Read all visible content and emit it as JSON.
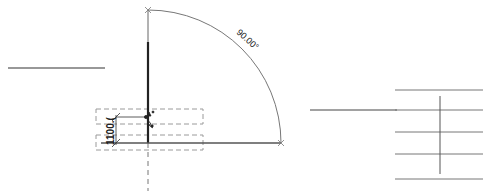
{
  "canvas": {
    "width": 488,
    "height": 191,
    "background": "#ffffff"
  },
  "colors": {
    "line": "#333333",
    "thin_line": "#555555",
    "light_line": "#888888",
    "dashed": "#999999"
  },
  "door": {
    "swing_angle_label": "90.00°",
    "width_dimension_label": "1100.(",
    "hinge": {
      "x": 148,
      "y": 143
    },
    "radius": 133
  },
  "annotations": {
    "angle": "90.00°",
    "dimension": "1100.("
  }
}
